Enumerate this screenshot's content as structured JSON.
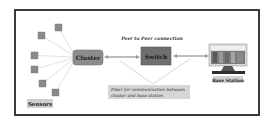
{
  "diagram": {
    "sensors_label": "Sensors",
    "cluster_label": "Cluster",
    "switch_label": "Switch",
    "base_station_label": "Base Station",
    "peer_connection_label": "Peer to Peer connection",
    "fiber_note_line1": "Fiber for communication between",
    "fiber_note_line2": "cluster and base station",
    "sensor_count": 6,
    "colors": {
      "sensor": "#8a8a8a",
      "cluster": "#8c8c8c",
      "switch": "#6f6f6f",
      "label_box": "#cfcfcf",
      "note_box": "#d6d6d6",
      "link": "#9a9a9a",
      "border": "#3a3a3a"
    }
  }
}
